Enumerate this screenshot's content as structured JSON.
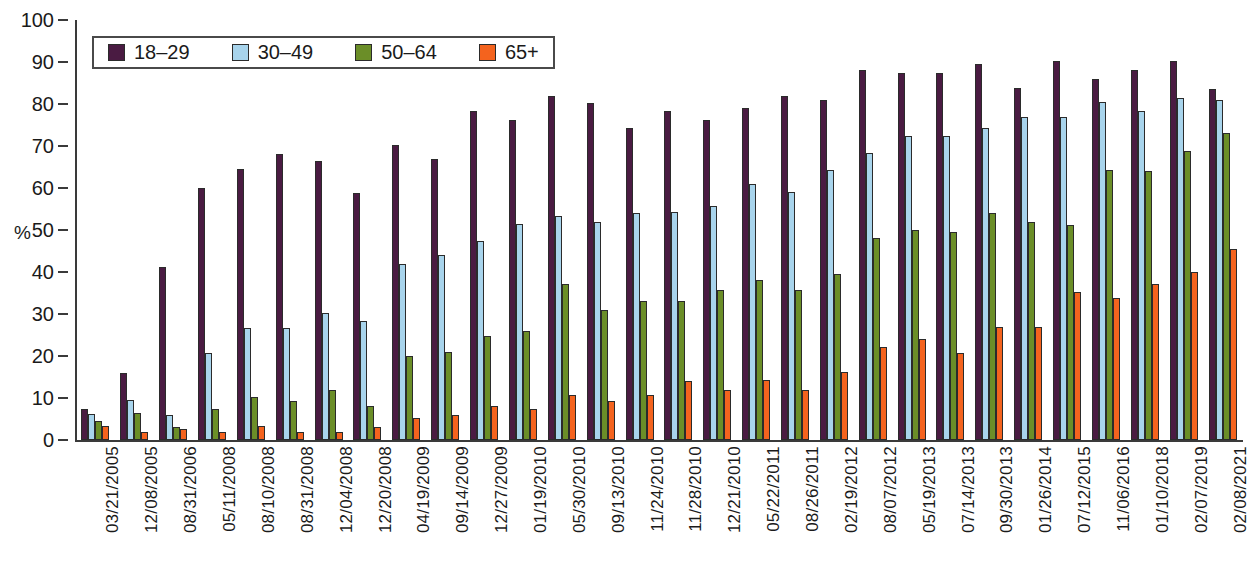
{
  "chart_data": {
    "type": "bar",
    "title": "",
    "xlabel": "",
    "ylabel": "%",
    "ylim": [
      0,
      100
    ],
    "ytick_step": 10,
    "yticks": [
      0,
      10,
      20,
      30,
      40,
      50,
      60,
      70,
      80,
      90,
      100
    ],
    "grid": false,
    "legend_position": "top-left",
    "categories": [
      "03/21/2005",
      "12/08/2005",
      "08/31/2006",
      "05/11/2008",
      "08/10/2008",
      "08/31/2008",
      "12/04/2008",
      "12/20/2008",
      "04/19/2009",
      "09/14/2009",
      "12/27/2009",
      "01/19/2010",
      "05/30/2010",
      "09/13/2010",
      "11/24/2010",
      "11/28/2010",
      "12/21/2010",
      "05/22/2011",
      "08/26/2011",
      "02/19/2012",
      "08/07/2012",
      "05/19/2013",
      "07/14/2013",
      "09/30/2013",
      "01/26/2014",
      "07/12/2015",
      "11/06/2016",
      "01/10/2018",
      "02/07/2019",
      "02/08/2021"
    ],
    "series": [
      {
        "name": "18–29",
        "color": "#4a1b42",
        "values": [
          7.3,
          16.0,
          41.3,
          60.0,
          64.5,
          68.0,
          66.5,
          58.8,
          70.3,
          66.8,
          78.3,
          76.2,
          81.8,
          80.3,
          74.2,
          78.3,
          76.3,
          79.0,
          81.8,
          81.0,
          88.0,
          87.3,
          87.3,
          89.6,
          83.7,
          90.3,
          86.0,
          88.0,
          90.3,
          83.5
        ]
      },
      {
        "name": "30–49",
        "color": "#a8d4ec",
        "values": [
          6.2,
          9.5,
          6.0,
          20.8,
          26.7,
          26.7,
          30.3,
          28.3,
          42.0,
          44.0,
          47.5,
          51.5,
          53.4,
          52.0,
          54.1,
          54.2,
          55.6,
          60.9,
          59.0,
          64.2,
          68.3,
          72.3,
          72.3,
          74.2,
          77.0,
          77.0,
          80.5,
          78.3,
          81.5,
          81.0
        ]
      },
      {
        "name": "50–64",
        "color": "#6b8e28",
        "values": [
          4.6,
          6.5,
          3.2,
          7.4,
          10.2,
          9.4,
          12.0,
          8.0,
          20.1,
          21.0,
          24.8,
          26.0,
          37.1,
          31.0,
          33.0,
          33.0,
          35.8,
          38.0,
          35.8,
          39.5,
          48.1,
          50.0,
          49.5,
          54.0,
          52.0,
          51.3,
          64.2,
          64.1,
          68.8,
          73.0
        ]
      },
      {
        "name": "65+",
        "color": "#f4631e",
        "values": [
          3.4,
          2.0,
          2.6,
          1.8,
          3.3,
          2.0,
          2.0,
          3.2,
          5.2,
          6.0,
          8.0,
          7.4,
          10.8,
          9.3,
          10.8,
          14.1,
          12.0,
          14.2,
          12.0,
          16.1,
          22.1,
          24.0,
          20.8,
          27.0,
          26.8,
          35.2,
          33.8,
          37.2,
          40.1,
          45.4
        ]
      }
    ]
  },
  "legend": {
    "items": [
      {
        "label": "18–29",
        "color": "#4a1b42"
      },
      {
        "label": "30–49",
        "color": "#a8d4ec"
      },
      {
        "label": "50–64",
        "color": "#6b8e28"
      },
      {
        "label": "65+",
        "color": "#f4631e"
      }
    ]
  }
}
